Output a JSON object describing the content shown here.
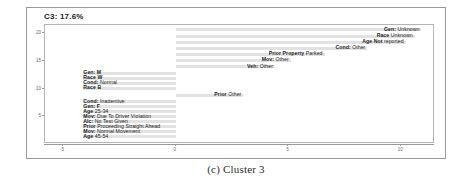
{
  "figure": {
    "caption": "(c)  Cluster 3",
    "title": "C3: 17.6%"
  },
  "chart_data": {
    "type": "bar",
    "orientation": "horizontal",
    "title": "C3: 17.6%",
    "xlabel": "",
    "ylabel": "",
    "xlim": [
      -5.8,
      11.5
    ],
    "ylim": [
      0,
      21.5
    ],
    "grid": false,
    "legend": null,
    "baseline": 0,
    "bar_color": "#e2e2e2",
    "xticks": [
      -5,
      0,
      5,
      10
    ],
    "xtick_labels": [
      "-5",
      "0",
      "5",
      "10"
    ],
    "yticks": [
      5,
      10,
      15,
      20
    ],
    "ytick_labels": [
      "5",
      "10",
      "15",
      "20"
    ],
    "categories": [
      "Gen: Unknown",
      "Race Unknown",
      "Age Not reported",
      "Cond: Other",
      "Prior Property Parked",
      "Mov: Other",
      "Veh: Other",
      "Gen: M",
      "Race W",
      "Cond: Normal",
      "Race B",
      "Prior Other",
      "Cond: Inattentive",
      "Gen: F",
      "Age 25-34",
      "Mov: Due To Driver Violation",
      "Alc: No Test Given",
      "Prior Proceeding Straight Ahead",
      "Mov: Normal Movement",
      "Age 45-54"
    ],
    "values": [
      10.9,
      10.6,
      10.2,
      8.5,
      6.6,
      5.1,
      4.4,
      -4.1,
      -4.1,
      -4.1,
      -4.1,
      3.0,
      -4.1,
      -4.1,
      -4.1,
      -4.1,
      -4.1,
      -4.1,
      -4.1,
      -4.1
    ],
    "y_positions": [
      20.6,
      19.5,
      18.4,
      17.3,
      16.2,
      15.1,
      14.0,
      12.8,
      11.9,
      11.0,
      10.1,
      8.8,
      7.6,
      6.7,
      5.8,
      4.9,
      4.0,
      3.1,
      2.2,
      1.3
    ]
  },
  "labels": [
    {
      "bold": "Gen:",
      "plain": "Unknown"
    },
    {
      "bold": "Race",
      "plain": "Unknown"
    },
    {
      "bold": "Age Not",
      "plain": "reported"
    },
    {
      "bold": "Cond:",
      "plain": "Other"
    },
    {
      "bold": "Prior Property",
      "plain": "Parked"
    },
    {
      "bold": "Mov:",
      "plain": "Other"
    },
    {
      "bold": "Veh:",
      "plain": "Other"
    },
    {
      "bold": "Gen: M",
      "plain": ""
    },
    {
      "bold": "Race W",
      "plain": ""
    },
    {
      "bold": "Cond:",
      "plain": "Normal"
    },
    {
      "bold": "Race B",
      "plain": ""
    },
    {
      "bold": "Prior",
      "plain": "Other"
    },
    {
      "bold": "Cond:",
      "plain": "Inattentive"
    },
    {
      "bold": "Gen: F",
      "plain": ""
    },
    {
      "bold": "Age",
      "plain": "25-34"
    },
    {
      "bold": "Mov:",
      "plain": "Due To Driver Violation"
    },
    {
      "bold": "Alc:",
      "plain": "No Test Given"
    },
    {
      "bold": "Prior",
      "plain": "Proceeding Straight Ahead"
    },
    {
      "bold": "Mov:",
      "plain": "Normal Movement"
    },
    {
      "bold": "Age",
      "plain": "45-54"
    }
  ]
}
